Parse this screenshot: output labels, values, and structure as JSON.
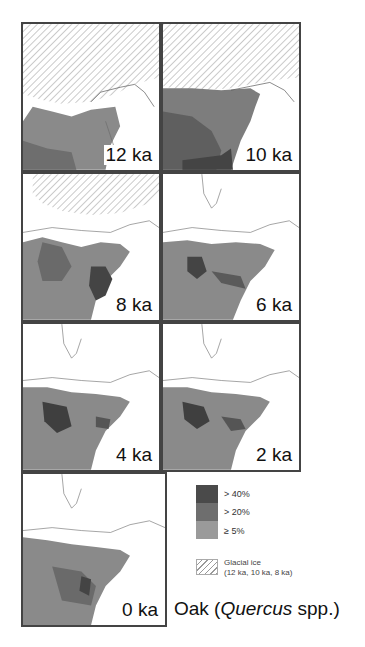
{
  "figure": {
    "panels": [
      {
        "label": "12 ka",
        "ice": true
      },
      {
        "label": "10 ka",
        "ice": true
      },
      {
        "label": "8 ka",
        "ice": true
      },
      {
        "label": "6 ka",
        "ice": false
      },
      {
        "label": "4 ka",
        "ice": false
      },
      {
        "label": "2 ka",
        "ice": false
      },
      {
        "label": "0 ka",
        "ice": false
      }
    ],
    "legend": {
      "items": [
        {
          "label": "> 40%",
          "color": "#4a4a4a"
        },
        {
          "label": "> 20%",
          "color": "#6e6e6e"
        },
        {
          "label": "≥ 5%",
          "color": "#9a9a9a"
        }
      ],
      "ice_label_line1": "Glacial ice",
      "ice_label_line2": "(12 ka, 10 ka, 8 ka)"
    },
    "title_prefix": "Oak (",
    "title_genus": "Quercus",
    "title_suffix": " spp.)"
  }
}
